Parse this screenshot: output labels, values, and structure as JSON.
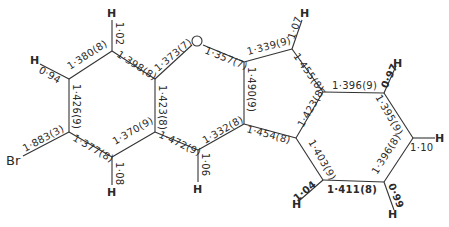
{
  "figure": {
    "type": "molecular-structure-bond-lengths",
    "atoms": {
      "Br": "Br",
      "O": "O",
      "H": "H"
    },
    "ringA": {
      "c_top_left_c_top": "1·380(8)",
      "c_top_c_top_right": "1·398(8)",
      "c_top_left_c_bottom_left": "1·426(9)",
      "br_c_bottom_left": "1·883(3)",
      "c_bottom_left_c_bottom": "1·377(8)",
      "c_bottom_c_bottom_right": "1·370(9)",
      "c_top_right_c_bottom_right": "1·423(8)",
      "h_top_left": "0·94",
      "h_top": "1·02",
      "h_bottom": "1·08"
    },
    "pyran": {
      "c_o": "1·373(7)",
      "o_c": "1·357(7)",
      "c_bottom_right_c_mid": "1·472(9)",
      "c_mid_c_right": "1·332(8)",
      "c_junction": "1·490(9)",
      "h_mid": "1·06"
    },
    "fivering": {
      "c_top": "1·339(9)",
      "c_top_c_right": "1·455(8)",
      "c_bottom": "1·454(8)",
      "h_top": "1·07"
    },
    "ringC": {
      "c_top": "1·396(9)",
      "c_top_right_c_right": "1·395(9)",
      "c_right_c_bottom_right": "1·396(8)",
      "c_bottom": "1·411(8)",
      "c_bottom_left_c_left": "1·403(9)",
      "c_left_c_top_left": "1·423(8)",
      "h_top_right": "0·97",
      "h_right": "1·10",
      "h_bottom_right": "0·99",
      "h_bottom_left": "1·04"
    }
  }
}
